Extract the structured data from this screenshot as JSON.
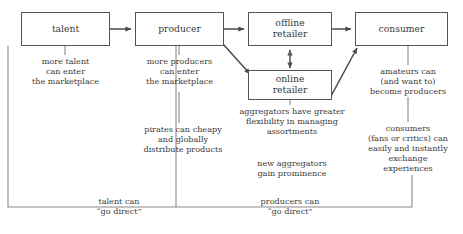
{
  "diagram": {
    "line_color": "#555555",
    "text_color": "#3a3a3a",
    "background": "#ffffff",
    "nodes": [
      {
        "id": "talent",
        "label": "talent",
        "x": 21,
        "y": 12,
        "w": 89,
        "h": 34
      },
      {
        "id": "producer",
        "label": "producer",
        "x": 135,
        "y": 12,
        "w": 89,
        "h": 34
      },
      {
        "id": "offline-retailer",
        "label": "offline\nretailer",
        "x": 248,
        "y": 12,
        "w": 84,
        "h": 34
      },
      {
        "id": "consumer",
        "label": "consumer",
        "x": 355,
        "y": 12,
        "w": 93,
        "h": 34
      },
      {
        "id": "online-retailer",
        "label": "online\nretailer",
        "x": 248,
        "y": 70,
        "w": 84,
        "h": 30
      }
    ],
    "notes": [
      {
        "id": "more-talent",
        "text": "more talent\ncan enter\nthe marketplace",
        "x": 13,
        "y": 56,
        "w": 105
      },
      {
        "id": "more-producers",
        "text": "more producers\ncan enter\nthe marketplace",
        "x": 127,
        "y": 56,
        "w": 105
      },
      {
        "id": "pirates",
        "text": "pirates can cheapy\nand globally\ndistribute products",
        "x": 127,
        "y": 124,
        "w": 112
      },
      {
        "id": "aggregators-flex",
        "text": "aggregators have greater\nflexibility in managing\nassortments",
        "x": 229,
        "y": 106,
        "w": 126
      },
      {
        "id": "new-aggregators",
        "text": "new aggregators\ngain prominence",
        "x": 237,
        "y": 158,
        "w": 110
      },
      {
        "id": "amateurs",
        "text": "amateurs can\n(and want to)\nbecome producers",
        "x": 358,
        "y": 66,
        "w": 100
      },
      {
        "id": "consumers-exchange",
        "text": "consumers\n(fans or critics) can\neasily and instantly\nexchange\nexperiences",
        "x": 356,
        "y": 123,
        "w": 104
      },
      {
        "id": "talent-go-direct",
        "text": "talent can\n“go direct”",
        "x": 71,
        "y": 196,
        "w": 96
      },
      {
        "id": "producers-go-direct",
        "text": "producers can\n“go direct”",
        "x": 238,
        "y": 196,
        "w": 104
      }
    ],
    "connections": [
      {
        "id": "talent-to-producer",
        "from": "talent",
        "to": "producer",
        "kind": "arrow"
      },
      {
        "id": "producer-to-offline-retailer",
        "from": "producer",
        "to": "offline-retailer",
        "kind": "arrow"
      },
      {
        "id": "offline-retailer-to-consumer",
        "from": "offline-retailer",
        "to": "consumer",
        "kind": "arrow"
      },
      {
        "id": "producer-to-online-retailer",
        "from": "producer",
        "to": "online-retailer",
        "kind": "arrow-diagonal"
      },
      {
        "id": "online-retailer-to-consumer",
        "from": "online-retailer",
        "to": "consumer",
        "kind": "arrow-diagonal"
      },
      {
        "id": "offline-online-retailer-link",
        "from": "online-retailer",
        "to": "offline-retailer",
        "kind": "double-arrow"
      },
      {
        "id": "talent-go-direct-bracket",
        "from": "talent",
        "to": "consumer",
        "kind": "bracket"
      },
      {
        "id": "producers-go-direct-bracket",
        "from": "producer",
        "to": "consumer",
        "kind": "bracket"
      },
      {
        "id": "amateurs-feedback",
        "from": "consumer",
        "to": "producer",
        "kind": "annotation-stem"
      }
    ]
  }
}
